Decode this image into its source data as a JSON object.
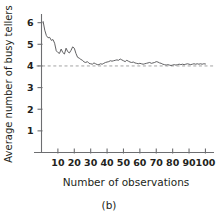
{
  "figure": {
    "caption": "(b)"
  },
  "chart_data": {
    "type": "line",
    "title": "",
    "xlabel": "Number of observations",
    "ylabel": "Average number of busy tellers",
    "xlim": [
      0,
      104
    ],
    "ylim": [
      0,
      6.4
    ],
    "xticks": [
      10,
      20,
      30,
      40,
      50,
      60,
      70,
      80,
      90,
      100
    ],
    "xticklabels": [
      "10",
      "20",
      "30",
      "40",
      "50",
      "60",
      "70",
      "80",
      "90",
      "100"
    ],
    "yticks": [
      1,
      2,
      3,
      4,
      5,
      6
    ],
    "yticklabels": [
      "1",
      "2",
      "3",
      "4",
      "5",
      "6"
    ],
    "grid": false,
    "legend": null,
    "line_color": "#58595b",
    "reference_line": {
      "value": 4.0,
      "style": "dashed",
      "color": "#9a9a9a",
      "orientation": "horizontal"
    },
    "series": [
      {
        "name": "Average number of busy tellers",
        "x": [
          1,
          2,
          3,
          4,
          5,
          6,
          7,
          8,
          9,
          10,
          11,
          12,
          13,
          14,
          15,
          16,
          17,
          18,
          19,
          20,
          21,
          22,
          23,
          24,
          25,
          26,
          27,
          28,
          29,
          30,
          31,
          32,
          33,
          34,
          35,
          36,
          37,
          38,
          39,
          40,
          41,
          42,
          43,
          44,
          45,
          46,
          47,
          48,
          49,
          50,
          51,
          52,
          53,
          54,
          55,
          56,
          57,
          58,
          59,
          60,
          61,
          62,
          63,
          64,
          65,
          66,
          67,
          68,
          69,
          70,
          71,
          72,
          73,
          74,
          75,
          76,
          77,
          78,
          79,
          80,
          81,
          82,
          83,
          84,
          85,
          86,
          87,
          88,
          89,
          90,
          91,
          92,
          93,
          94,
          95,
          96,
          97,
          98,
          99,
          100
        ],
        "y": [
          6.05,
          5.65,
          5.4,
          5.3,
          5.32,
          5.18,
          5.22,
          5.05,
          4.7,
          4.62,
          4.58,
          4.78,
          4.62,
          4.55,
          4.82,
          4.66,
          4.6,
          4.72,
          4.88,
          4.82,
          4.58,
          4.4,
          4.36,
          4.3,
          4.26,
          4.18,
          4.16,
          4.2,
          4.12,
          4.1,
          4.08,
          4.14,
          4.1,
          4.06,
          4.06,
          4.1,
          4.08,
          4.12,
          4.16,
          4.18,
          4.2,
          4.24,
          4.22,
          4.24,
          4.26,
          4.28,
          4.26,
          4.32,
          4.28,
          4.24,
          4.2,
          4.26,
          4.22,
          4.18,
          4.16,
          4.18,
          4.14,
          4.12,
          4.1,
          4.12,
          4.1,
          4.08,
          4.1,
          4.12,
          4.14,
          4.16,
          4.12,
          4.14,
          4.16,
          4.2,
          4.18,
          4.14,
          4.12,
          4.08,
          4.06,
          4.04,
          4.06,
          4.04,
          4.02,
          4.04,
          4.06,
          4.04,
          4.06,
          4.08,
          4.06,
          4.08,
          4.06,
          4.08,
          4.1,
          4.08,
          4.06,
          4.08,
          4.1,
          4.08,
          4.1,
          4.08,
          4.1,
          4.08,
          4.1,
          4.09
        ]
      }
    ]
  }
}
